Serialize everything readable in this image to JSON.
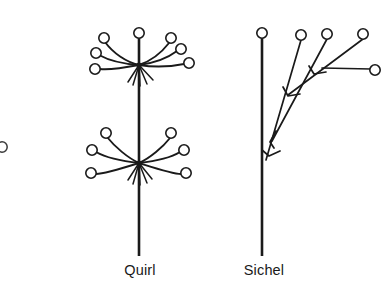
{
  "figure": {
    "background_color": "#ffffff",
    "ink_color": "#1a1a1a",
    "width": 383,
    "height": 290
  },
  "diagrams": [
    {
      "id": "quirl",
      "label": "Quirl",
      "label_position": {
        "x": 140,
        "y": 269
      },
      "type": "whorl",
      "axis": {
        "name": "main-stem",
        "x": 139,
        "y_top": 33,
        "y_bottom": 256,
        "stroke_width": 2.6
      },
      "apex_flower": {
        "cx": 139,
        "cy": 33,
        "r": 5.2
      },
      "nodes": [
        {
          "name": "upper-whorl-node",
          "cx": 139,
          "cy": 65,
          "branch_count": 6,
          "flowers": [
            {
              "cx": 104,
              "cy": 38,
              "r": 5.2
            },
            {
              "cx": 96,
              "cy": 53,
              "r": 5.2
            },
            {
              "cx": 95,
              "cy": 69,
              "r": 5.2
            },
            {
              "cx": 171,
              "cy": 38,
              "r": 5.2
            },
            {
              "cx": 181,
              "cy": 49,
              "r": 5.2
            },
            {
              "cx": 189,
              "cy": 63,
              "r": 5.2
            }
          ],
          "spike_count": 5
        },
        {
          "name": "lower-whorl-node",
          "cx": 139,
          "cy": 163,
          "branch_count": 6,
          "flowers": [
            {
              "cx": 106,
              "cy": 133,
              "r": 5.2
            },
            {
              "cx": 92,
              "cy": 150,
              "r": 5.2
            },
            {
              "cx": 91,
              "cy": 173,
              "r": 5.2
            },
            {
              "cx": 171,
              "cy": 133,
              "r": 5.2
            },
            {
              "cx": 184,
              "cy": 150,
              "r": 5.2
            },
            {
              "cx": 186,
              "cy": 173,
              "r": 5.2
            }
          ],
          "spike_count": 5
        }
      ]
    },
    {
      "id": "sichel",
      "label": "Sichel",
      "label_position": {
        "x": 264,
        "y": 269
      },
      "type": "helicoid-cyme",
      "axis": {
        "name": "main-stem",
        "x": 262,
        "y_top": 35,
        "y_bottom": 256,
        "stroke_width": 2.6
      },
      "apex_flower": {
        "cx": 262,
        "cy": 33,
        "r": 5.2
      },
      "branch_nodes": [
        {
          "name": "node-1",
          "cx": 268,
          "cy": 153,
          "arrow": true
        },
        {
          "name": "node-2",
          "cx": 288,
          "cy": 95,
          "arrow": true
        },
        {
          "name": "node-3",
          "cx": 313,
          "cy": 72,
          "arrow": true
        },
        {
          "name": "node-4",
          "cx": 344,
          "cy": 57,
          "arrow": true
        }
      ],
      "flowers": [
        {
          "cx": 301,
          "cy": 35,
          "r": 5.2
        },
        {
          "cx": 327,
          "cy": 34,
          "r": 5.2
        },
        {
          "cx": 363,
          "cy": 34,
          "r": 5.2
        },
        {
          "cx": 375,
          "cy": 70,
          "r": 5.2
        }
      ]
    }
  ],
  "edge_artifacts": [
    {
      "name": "cropped-flower-left",
      "cx": 2,
      "cy": 147,
      "r": 5.2
    }
  ]
}
